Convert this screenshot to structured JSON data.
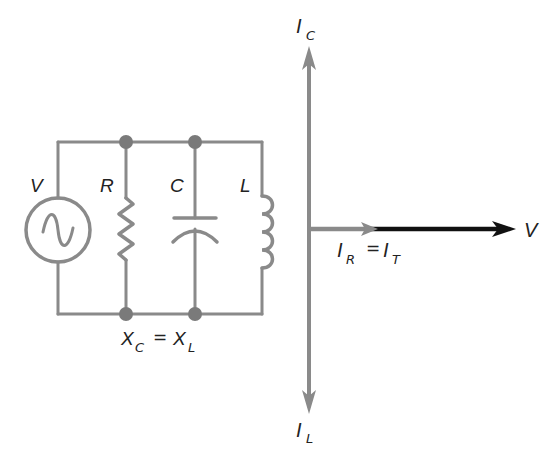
{
  "figure": {
    "colors": {
      "wire": "#8a8a8a",
      "node": "#7a7a7a",
      "phasor_gray": "#8a8a8a",
      "phasor_voltage": "#111111",
      "text": "#222222"
    }
  },
  "circuit": {
    "source_label": "V",
    "resistor_label": "R",
    "capacitor_label": "C",
    "inductor_label": "L",
    "condition": {
      "lhs_main": "X",
      "lhs_sub": "C",
      "equals": "=",
      "rhs_main": "X",
      "rhs_sub": "L"
    }
  },
  "phasor": {
    "ic": {
      "main": "I",
      "sub": "C"
    },
    "il": {
      "main": "I",
      "sub": "L"
    },
    "v_label": "V",
    "ir_it": {
      "lhs_main": "I",
      "lhs_sub": "R",
      "equals": "=",
      "rhs_main": "I",
      "rhs_sub": "T"
    }
  }
}
